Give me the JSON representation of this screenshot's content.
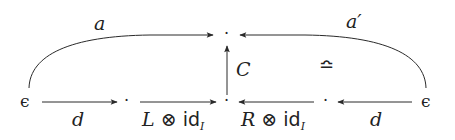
{
  "diagram": {
    "type": "commutative-diagram",
    "colors": {
      "stroke": "#2a2a2a",
      "text": "#222222",
      "background": "#ffffff"
    },
    "nodes": {
      "left_epsilon": {
        "label": "ϵ",
        "x": 25,
        "y": 102
      },
      "mid_left_dot": {
        "label": "·",
        "x": 127,
        "y": 102
      },
      "center_bottom_dot": {
        "label": "·",
        "x": 227,
        "y": 102
      },
      "mid_right_dot": {
        "label": "·",
        "x": 326,
        "y": 102
      },
      "right_epsilon": {
        "label": "ϵ",
        "x": 426,
        "y": 102
      },
      "top_dot": {
        "label": "·",
        "x": 227,
        "y": 35
      }
    },
    "edges": [
      {
        "id": "a",
        "from": "left_epsilon",
        "to": "top_dot",
        "label": "a",
        "curved": true
      },
      {
        "id": "a_prime",
        "from": "right_epsilon",
        "to": "top_dot",
        "label": "a′",
        "curved": true
      },
      {
        "id": "d_left",
        "from": "left_epsilon",
        "to": "mid_left_dot",
        "label": "d"
      },
      {
        "id": "L_tensor",
        "from": "mid_left_dot",
        "to": "center_bottom_dot",
        "label_main": "L",
        "label_op": "⊗",
        "label_id": "id",
        "label_sub": "I"
      },
      {
        "id": "R_tensor",
        "from": "mid_right_dot",
        "to": "center_bottom_dot",
        "label_main": "R",
        "label_op": "⊗",
        "label_id": "id",
        "label_sub": "I"
      },
      {
        "id": "d_right",
        "from": "right_epsilon",
        "to": "mid_right_dot",
        "label": "d"
      },
      {
        "id": "C",
        "from": "center_bottom_dot",
        "to": "top_dot",
        "label": "C"
      }
    ],
    "annotations": {
      "equivalence_symbol": "≏"
    }
  }
}
